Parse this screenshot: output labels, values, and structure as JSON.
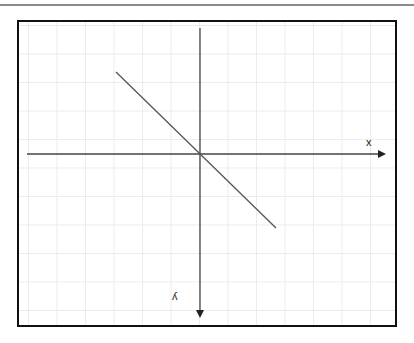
{
  "diagram": {
    "type": "coordinate-axes-with-line",
    "axes": {
      "x_label": "x",
      "y_label": "y",
      "y_label_rendered": "ʎ",
      "x_direction": "right",
      "y_direction": "down"
    },
    "line": {
      "description": "straight line through origin with negative slope (descending left-to-right)",
      "start": {
        "x": 116,
        "y": 72
      },
      "end": {
        "x": 276,
        "y": 228
      }
    },
    "colors": {
      "frame": "#111111",
      "axis": "#444444",
      "line": "#555555",
      "grid": "#ececec",
      "top_rule": "#8a8a8a"
    }
  }
}
